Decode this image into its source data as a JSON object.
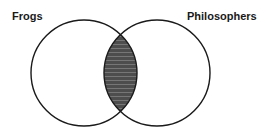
{
  "diagram": {
    "type": "venn",
    "sets": [
      {
        "name": "Frogs",
        "position": "left"
      },
      {
        "name": "Philosophers",
        "position": "right"
      }
    ],
    "highlighted_region": "intersection",
    "highlight_style": "dark gray horizontal hatching",
    "colors": {
      "outline": "#1a1a1a",
      "fill": "#555555",
      "hatch_line": "#7a7a7a",
      "background": "#ffffff"
    }
  },
  "labels": {
    "left": "Frogs",
    "right": "Philosophers"
  }
}
